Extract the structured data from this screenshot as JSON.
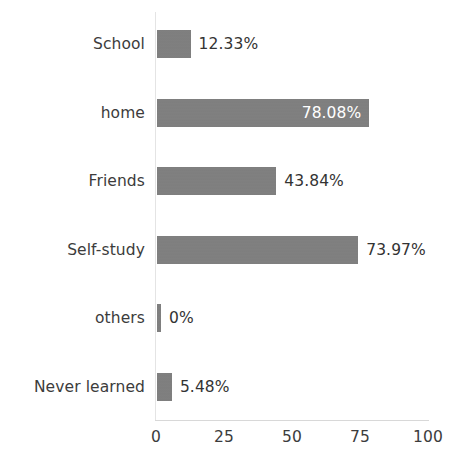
{
  "chart_data": {
    "type": "bar",
    "orientation": "horizontal",
    "title": "",
    "subtitle": "",
    "xlabel": "",
    "ylabel": "",
    "xlim": [
      0,
      100
    ],
    "grid": false,
    "legend": null,
    "bar_color": "#7f7f7f",
    "text_color": "#3c3c3c",
    "inside_label_color": "#ffffff",
    "background_color": "#ffffff",
    "categories": [
      "School",
      "home",
      "Friends",
      "Self-study",
      "others",
      "Never learned"
    ],
    "values": [
      12.33,
      78.08,
      43.84,
      73.97,
      0,
      5.48
    ],
    "tick_labels": [
      "0",
      "25",
      "50",
      "75",
      "100"
    ],
    "tick_values": [
      0,
      25,
      50,
      75,
      100
    ],
    "bars": [
      {
        "category": "School",
        "value": 12.33,
        "label": "12.33%",
        "label_inside": false,
        "bar_units": 12.33
      },
      {
        "category": "home",
        "value": 78.08,
        "label": "78.08%",
        "label_inside": true,
        "bar_units": 78.08
      },
      {
        "category": "Friends",
        "value": 43.84,
        "label": "43.84%",
        "label_inside": false,
        "bar_units": 43.84
      },
      {
        "category": "Self-study",
        "value": 73.97,
        "label": "73.97%",
        "label_inside": false,
        "bar_units": 73.97
      },
      {
        "category": "others",
        "value": 0,
        "label": "0%",
        "label_inside": false,
        "bar_units": 1.4
      },
      {
        "category": "Never learned",
        "value": 5.48,
        "label": "5.48%",
        "label_inside": false,
        "bar_units": 5.48
      }
    ]
  }
}
